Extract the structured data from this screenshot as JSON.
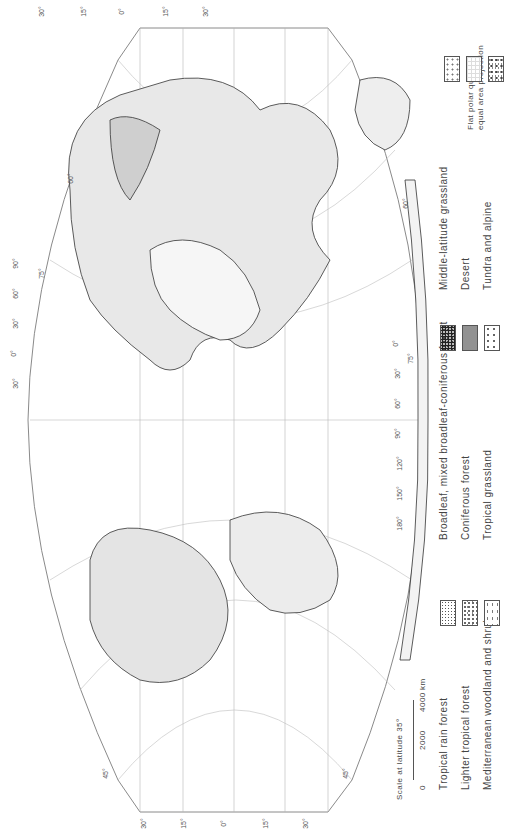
{
  "map": {
    "title": "World natural vegetation regions",
    "projection_note_line1": "Flat polar quartic",
    "projection_note_line2": "equal area projection",
    "orientation": "rotated 90 degrees (text reads bottom-to-top)",
    "scale": {
      "label": "Scale at latitude 35°",
      "ticks": [
        "0",
        "2000",
        "4000"
      ],
      "unit": "km"
    },
    "latitude_labels_top": [
      "30°",
      "15°",
      "0°",
      "15°",
      "30°"
    ],
    "latitude_labels_bottom": [
      "30°",
      "15°",
      "0°",
      "15°",
      "30°"
    ],
    "longitude_labels_left": [
      "90°",
      "60°",
      "30°",
      "0°",
      "30°",
      "60°",
      "90°",
      "120°",
      "150°",
      "180°",
      "90°"
    ],
    "longitude_labels_right": [
      "90°",
      "180°",
      "150°",
      "120°",
      "90°",
      "60°",
      "30°",
      "0°",
      "30°",
      "60°",
      "90°",
      "120°",
      "150°",
      "180°",
      "90°"
    ],
    "parallel_labels": [
      "75°",
      "60°",
      "45°",
      "45°",
      "60°",
      "75°"
    ]
  },
  "legend": {
    "items": [
      {
        "label": "Tropical rain forest",
        "pattern": "rain"
      },
      {
        "label": "Lighter tropical forest",
        "pattern": "light"
      },
      {
        "label": "Mediterranean woodland and shrub",
        "pattern": "med"
      },
      {
        "label": "Broadleaf, mixed broadleaf-coniferous forest",
        "pattern": "broad"
      },
      {
        "label": "Coniferous forest",
        "pattern": "conif"
      },
      {
        "label": "Tropical grassland",
        "pattern": "tropgrass"
      },
      {
        "label": "Middle-latitude grassland",
        "pattern": "midgrass"
      },
      {
        "label": "Desert",
        "pattern": "desert"
      },
      {
        "label": "Tundra and alpine",
        "pattern": "tundra"
      }
    ]
  },
  "colors": {
    "line": "#9a9a9a",
    "coast": "#333333",
    "background": "#ffffff"
  }
}
